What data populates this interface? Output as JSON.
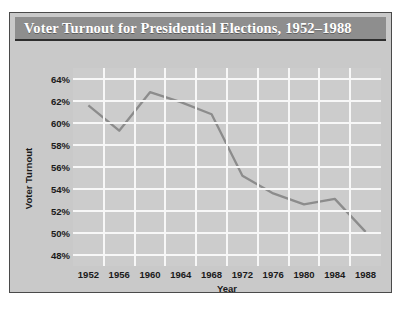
{
  "figure": {
    "title": "Voter Turnout for Presidential Elections, 1952–1988",
    "border_color": "#4a4a4a",
    "panel_color": "#c9c9c9",
    "title_bar_color": "#8e8e8e",
    "title_text_color": "#ffffff"
  },
  "chart_data": {
    "type": "line",
    "title": "Voter Turnout for Presidential Elections, 1952–1988",
    "xlabel": "Year",
    "ylabel": "Voter Turnout",
    "categories": [
      "1952",
      "1956",
      "1960",
      "1964",
      "1968",
      "1972",
      "1976",
      "1980",
      "1984",
      "1988"
    ],
    "x": [
      1952,
      1956,
      1960,
      1964,
      1968,
      1972,
      1976,
      1980,
      1984,
      1988
    ],
    "values": [
      61.6,
      59.3,
      62.8,
      61.9,
      60.8,
      55.2,
      53.6,
      52.6,
      53.1,
      50.1
    ],
    "series": [
      {
        "name": "Voter Turnout",
        "values": [
          61.6,
          59.3,
          62.8,
          61.9,
          60.8,
          55.2,
          53.6,
          52.6,
          53.1,
          50.1
        ]
      }
    ],
    "ylim": [
      47,
      65
    ],
    "ytick_values": [
      48,
      50,
      52,
      54,
      56,
      58,
      60,
      62,
      64
    ],
    "ytick_labels": [
      "48%",
      "50%",
      "52%",
      "54%",
      "56%",
      "58%",
      "60%",
      "62%",
      "64%"
    ],
    "xtick_labels": [
      "1952",
      "1956",
      "1960",
      "1964",
      "1968",
      "1972",
      "1976",
      "1980",
      "1984",
      "1988"
    ],
    "grid": true,
    "grid_color": "#f7f7f7",
    "plot_background": "#cccccc",
    "line_color": "#8c8c8c",
    "line_width": 2.3,
    "legend": false,
    "legend_position": "none",
    "markers": false
  }
}
